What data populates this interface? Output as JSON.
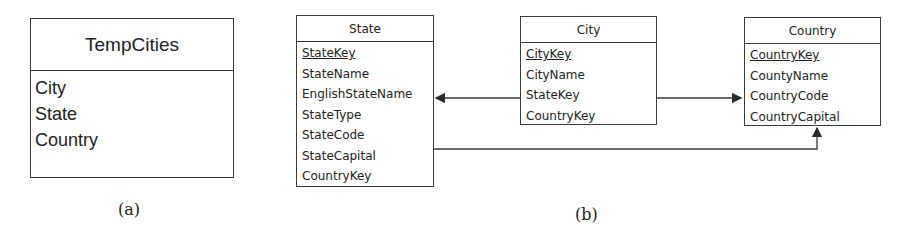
{
  "panel_a": {
    "caption": "(a)",
    "table": {
      "title": "TempCities",
      "fields": [
        "City",
        "State",
        "Country"
      ]
    }
  },
  "panel_b": {
    "caption": "(b)",
    "tables": {
      "state": {
        "title": "State",
        "primary_key": "StateKey",
        "fields": [
          "StateName",
          "EnglishStateName",
          "StateType",
          "StateCode",
          "StateCapital",
          "CountryKey"
        ]
      },
      "city": {
        "title": "City",
        "primary_key": "CityKey",
        "fields": [
          "CityName",
          "StateKey",
          "CountryKey"
        ]
      },
      "country": {
        "title": "Country",
        "primary_key": "CountryKey",
        "fields": [
          "CountyName",
          "CountryCode",
          "CountryCapital"
        ]
      }
    },
    "relationships": [
      {
        "from": "City.StateKey",
        "to": "State"
      },
      {
        "from": "City.CountryKey",
        "to": "Country"
      },
      {
        "from": "State.CountryKey",
        "to": "Country"
      }
    ]
  },
  "colors": {
    "line": "#3a3a3a",
    "text": "#222222",
    "background": "#ffffff"
  }
}
